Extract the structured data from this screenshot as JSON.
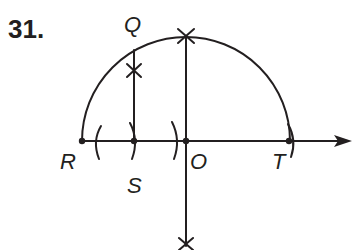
{
  "problem": {
    "number": "31."
  },
  "points": {
    "Q": {
      "label": "Q",
      "x": 134,
      "y": 50
    },
    "R": {
      "label": "R",
      "x": 82,
      "y": 141
    },
    "S": {
      "label": "S",
      "x": 134,
      "y": 141
    },
    "O": {
      "label": "O",
      "x": 186,
      "y": 141
    },
    "T": {
      "label": "T",
      "x": 289,
      "y": 141
    }
  },
  "construction": {
    "semicircle": {
      "center": "O",
      "radius": 104
    },
    "horizontal_ray": {
      "from": "R",
      "direction": "right",
      "arrow": true
    },
    "perpendicular_at_O": {
      "marks": [
        "top X on arc",
        "bottom X"
      ]
    },
    "perpendicular_at_S": {
      "to": "Q",
      "marks": [
        "X on segment"
      ]
    },
    "arc_marks": [
      "( left of S",
      ") at S",
      ") left of O",
      ") at T"
    ]
  },
  "colors": {
    "ink": "#231f20",
    "background": "#ffffff"
  }
}
